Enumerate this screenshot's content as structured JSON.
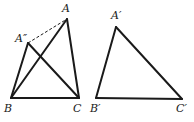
{
  "figures": [
    {
      "id": "left-figure",
      "points": {
        "A": {
          "x": 67,
          "y": 19,
          "label": "A",
          "lx": 62,
          "ly": 12
        },
        "A2": {
          "x": 28,
          "y": 43,
          "label": "A″",
          "lx": 15,
          "ly": 42
        },
        "B": {
          "x": 11,
          "y": 98,
          "label": "B",
          "lx": 4,
          "ly": 112
        },
        "C": {
          "x": 79,
          "y": 98,
          "label": "C",
          "lx": 73,
          "ly": 112
        }
      },
      "solid_segments": [
        [
          "A",
          "B"
        ],
        [
          "A",
          "C"
        ],
        [
          "B",
          "C"
        ],
        [
          "A2",
          "B"
        ],
        [
          "A2",
          "C"
        ]
      ],
      "dashed_segments": [
        [
          "A2",
          "A"
        ]
      ]
    },
    {
      "id": "right-figure",
      "points": {
        "A1": {
          "x": 116,
          "y": 27,
          "label": "A′",
          "lx": 111,
          "ly": 19
        },
        "B1": {
          "x": 96,
          "y": 98,
          "label": "B′",
          "lx": 90,
          "ly": 112
        },
        "C1": {
          "x": 182,
          "y": 99,
          "label": "C′",
          "lx": 176,
          "ly": 112
        }
      },
      "solid_segments": [
        [
          "A1",
          "B1"
        ],
        [
          "A1",
          "C1"
        ],
        [
          "B1",
          "C1"
        ]
      ],
      "dashed_segments": []
    }
  ],
  "colors": {
    "stroke": "#1a1a1a",
    "background": "#ffffff"
  }
}
